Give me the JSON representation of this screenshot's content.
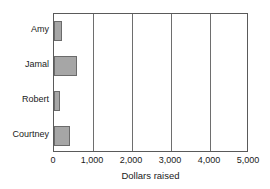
{
  "chart_data": {
    "type": "bar",
    "orientation": "horizontal",
    "title": "",
    "xlabel": "Dollars raised",
    "ylabel": "",
    "categories": [
      "Amy",
      "Jamal",
      "Robert",
      "Courtney"
    ],
    "values": [
      200,
      600,
      150,
      400
    ],
    "xlim": [
      0,
      5000
    ],
    "xticks": [
      0,
      1000,
      2000,
      3000,
      4000,
      5000
    ],
    "xtick_labels": [
      "0",
      "1,000",
      "2,000",
      "3,000",
      "4,000",
      "5,000"
    ],
    "grid": true,
    "grid_axis": "x",
    "legend": false,
    "bar_color": "#a6a6a6",
    "bar_edge_color": "#6b6b6b",
    "axis_color": "#5a5a5a",
    "background": "#ffffff"
  },
  "axis": {
    "xlabel": "Dollars raised"
  },
  "bars": [
    {
      "label": "Amy",
      "value": 200
    },
    {
      "label": "Jamal",
      "value": 600
    },
    {
      "label": "Robert",
      "value": 150
    },
    {
      "label": "Courtney",
      "value": 400
    }
  ],
  "ticks": [
    {
      "value": 0,
      "label": "0"
    },
    {
      "value": 1000,
      "label": "1,000"
    },
    {
      "value": 2000,
      "label": "2,000"
    },
    {
      "value": 3000,
      "label": "3,000"
    },
    {
      "value": 4000,
      "label": "4,000"
    },
    {
      "value": 5000,
      "label": "5,000"
    }
  ]
}
